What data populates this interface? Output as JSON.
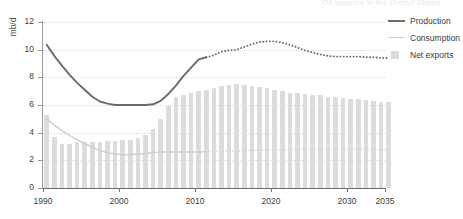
{
  "title_fragment": "Oil balance in the United States",
  "axis": {
    "ylabel": "mb/d",
    "yticks": [
      "0",
      "2",
      "4",
      "6",
      "8",
      "10",
      "12"
    ],
    "xticks": [
      "1990",
      "2000",
      "2010",
      "2020",
      "2030",
      "2035"
    ]
  },
  "legend": {
    "position": "top-right",
    "items": [
      {
        "label": "Production",
        "key": "production-line-key",
        "color": "#6b6b6b"
      },
      {
        "label": "Consumption",
        "key": "consumption-line-key",
        "color": "#cfcfcf"
      },
      {
        "label": "Net exports",
        "key": "net-exports-swatch-key",
        "color": "#dcdcdc"
      }
    ]
  },
  "chart_data": {
    "type": "line",
    "title": "Oil balance in the United States",
    "xlabel": "",
    "ylabel": "mb/d",
    "xlim": [
      1990,
      2035
    ],
    "ylim": [
      0,
      12
    ],
    "grid": true,
    "legend_position": "top-right",
    "projection_starts": 2011,
    "x": [
      1990,
      1991,
      1992,
      1993,
      1994,
      1995,
      1996,
      1997,
      1998,
      1999,
      2000,
      2001,
      2002,
      2003,
      2004,
      2005,
      2006,
      2007,
      2008,
      2009,
      2010,
      2011,
      2012,
      2013,
      2014,
      2015,
      2016,
      2017,
      2018,
      2019,
      2020,
      2021,
      2022,
      2023,
      2024,
      2025,
      2026,
      2027,
      2028,
      2029,
      2030,
      2031,
      2032,
      2033,
      2034,
      2035
    ],
    "series": [
      {
        "name": "Production",
        "color": "#6b6b6b",
        "style": "solid-then-dotted",
        "values": [
          10.35,
          9.55,
          8.85,
          8.2,
          7.6,
          7.1,
          6.6,
          6.25,
          6.1,
          6.0,
          6.0,
          6.0,
          6.0,
          6.0,
          6.05,
          6.3,
          6.8,
          7.4,
          8.1,
          8.7,
          9.3,
          9.45,
          9.6,
          9.85,
          9.95,
          10.0,
          10.2,
          10.4,
          10.55,
          10.6,
          10.6,
          10.5,
          10.35,
          10.15,
          9.95,
          9.8,
          9.65,
          9.55,
          9.5,
          9.5,
          9.5,
          9.5,
          9.45,
          9.45,
          9.4,
          9.4
        ]
      },
      {
        "name": "Consumption",
        "color": "#cfcfcf",
        "style": "solid-then-dotted",
        "values": [
          5.0,
          4.55,
          4.15,
          3.8,
          3.5,
          3.2,
          2.95,
          2.7,
          2.55,
          2.45,
          2.4,
          2.42,
          2.45,
          2.5,
          2.55,
          2.6,
          2.6,
          2.6,
          2.6,
          2.6,
          2.6,
          2.62,
          2.65,
          2.65,
          2.68,
          2.68,
          2.7,
          2.72,
          2.72,
          2.72,
          2.75,
          2.78,
          2.8,
          2.82,
          2.82,
          2.82,
          2.82,
          2.82,
          2.82,
          2.82,
          2.8,
          2.8,
          2.8,
          2.8,
          2.78,
          2.78
        ]
      }
    ],
    "bars": {
      "name": "Net exports",
      "color": "#dcdcdc",
      "values": [
        5.3,
        3.7,
        3.2,
        3.2,
        3.3,
        3.35,
        3.3,
        3.35,
        3.4,
        3.4,
        3.45,
        3.5,
        3.6,
        3.8,
        4.3,
        5.0,
        5.9,
        6.6,
        6.7,
        6.9,
        7.0,
        7.1,
        7.25,
        7.4,
        7.45,
        7.5,
        7.45,
        7.4,
        7.3,
        7.2,
        7.1,
        7.0,
        6.9,
        6.85,
        6.8,
        6.75,
        6.7,
        6.6,
        6.55,
        6.5,
        6.45,
        6.4,
        6.35,
        6.3,
        6.25,
        6.2
      ]
    }
  }
}
